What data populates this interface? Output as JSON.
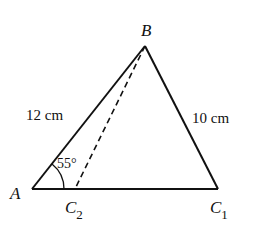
{
  "diagram": {
    "type": "triangle-ambiguous-case",
    "vertices": {
      "A": {
        "label": "A",
        "x": 32,
        "y": 189
      },
      "B": {
        "label": "B",
        "x": 145,
        "y": 46
      },
      "C1": {
        "label": "C",
        "sub": "1",
        "x": 218,
        "y": 189
      },
      "C2": {
        "label": "C",
        "sub": "2",
        "x": 75,
        "y": 189
      }
    },
    "sides": {
      "AB": {
        "label": "12 cm"
      },
      "BC1": {
        "label": "10 cm"
      }
    },
    "angle_A": {
      "label": "55°"
    },
    "colors": {
      "stroke": "#111111",
      "background": "#ffffff"
    }
  }
}
